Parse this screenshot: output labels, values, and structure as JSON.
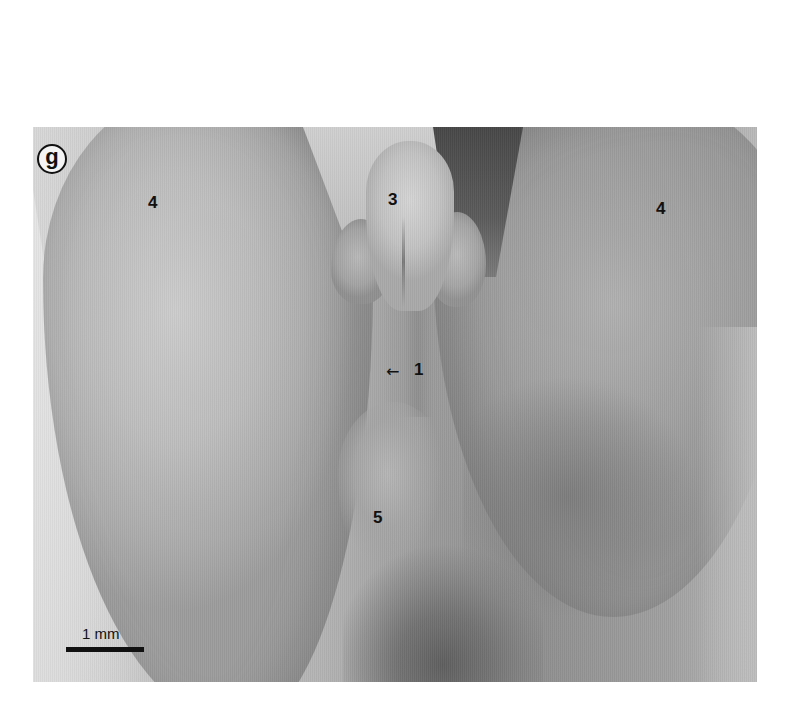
{
  "figure": {
    "panel_label": "g",
    "labels": [
      {
        "id": "petal-left",
        "text": "4"
      },
      {
        "id": "center-structure",
        "text": "3"
      },
      {
        "id": "petal-right",
        "text": "4"
      },
      {
        "id": "pointer-target",
        "text": "1"
      },
      {
        "id": "lower-structure",
        "text": "5"
      }
    ],
    "arrow_glyph": "←",
    "scale_bar": {
      "label": "1 mm"
    },
    "colors": {
      "background": "#ffffff",
      "label_color": "#111111",
      "photo_light": "#d8d8d8",
      "photo_dark": "#474747"
    }
  }
}
